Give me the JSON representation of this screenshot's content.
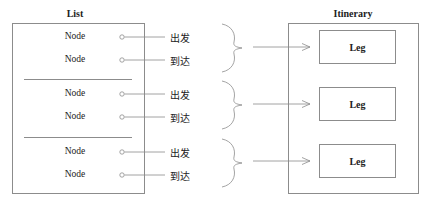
{
  "list": {
    "title": "List",
    "groups": [
      {
        "nodes": [
          {
            "label": "Node",
            "connector": "出发"
          },
          {
            "label": "Node",
            "connector": "到达"
          }
        ]
      },
      {
        "nodes": [
          {
            "label": "Node",
            "connector": "出发"
          },
          {
            "label": "Node",
            "connector": "到达"
          }
        ]
      },
      {
        "nodes": [
          {
            "label": "Node",
            "connector": "出发"
          },
          {
            "label": "Node",
            "connector": "到达"
          }
        ]
      }
    ]
  },
  "itinerary": {
    "title": "Itinerary",
    "legs": [
      {
        "label": "Leg"
      },
      {
        "label": "Leg"
      },
      {
        "label": "Leg"
      }
    ]
  },
  "colors": {
    "stroke": "#8c8c8c",
    "text": "#222222"
  }
}
